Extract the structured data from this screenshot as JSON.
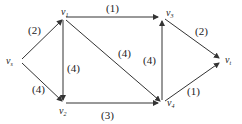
{
  "diagram": {
    "type": "directed-network",
    "nodes": [
      {
        "id": "vs",
        "label": "v",
        "sub": "s",
        "x": 20,
        "y": 61
      },
      {
        "id": "v1",
        "label": "v",
        "sub": "1",
        "x": 63,
        "y": 17
      },
      {
        "id": "v2",
        "label": "v",
        "sub": "2",
        "x": 63,
        "y": 103
      },
      {
        "id": "v3",
        "label": "v",
        "sub": "3",
        "x": 162,
        "y": 17
      },
      {
        "id": "v4",
        "label": "v",
        "sub": "4",
        "x": 162,
        "y": 103
      },
      {
        "id": "vt",
        "label": "v",
        "sub": "t",
        "x": 220,
        "y": 61
      }
    ],
    "edges": [
      {
        "from": "vs",
        "to": "v1",
        "weight": "(2)"
      },
      {
        "from": "vs",
        "to": "v2",
        "weight": "(4)"
      },
      {
        "from": "v1",
        "to": "v3",
        "weight": "(1)"
      },
      {
        "from": "v1",
        "to": "v2",
        "weight": "(4)"
      },
      {
        "from": "v1",
        "to": "v4",
        "weight": "(4)"
      },
      {
        "from": "v2",
        "to": "v4",
        "weight": "(3)"
      },
      {
        "from": "v4",
        "to": "v3",
        "weight": "(4)"
      },
      {
        "from": "v3",
        "to": "vt",
        "weight": "(2)"
      },
      {
        "from": "v4",
        "to": "vt",
        "weight": "(1)"
      }
    ]
  }
}
